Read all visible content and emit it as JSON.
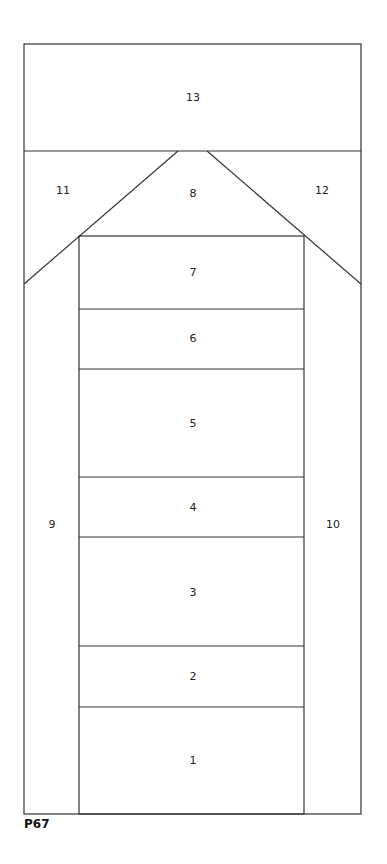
{
  "diagram": {
    "caption": "P67",
    "line_color": "#333333",
    "pieces": [
      {
        "id": "1",
        "label": "1"
      },
      {
        "id": "2",
        "label": "2"
      },
      {
        "id": "3",
        "label": "3"
      },
      {
        "id": "4",
        "label": "4"
      },
      {
        "id": "5",
        "label": "5"
      },
      {
        "id": "6",
        "label": "6"
      },
      {
        "id": "7",
        "label": "7"
      },
      {
        "id": "8",
        "label": "8"
      },
      {
        "id": "9",
        "label": "9"
      },
      {
        "id": "10",
        "label": "10"
      },
      {
        "id": "11",
        "label": "11"
      },
      {
        "id": "12",
        "label": "12"
      },
      {
        "id": "13",
        "label": "13"
      }
    ]
  }
}
